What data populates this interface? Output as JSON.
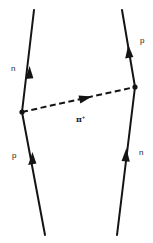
{
  "diagram": {
    "type": "feynman",
    "colors": {
      "line": "#141414",
      "background": "#ffffff",
      "text": "#1a1a1a"
    },
    "left_line": {
      "top_label": "n",
      "bottom_label": "p",
      "points": {
        "top": [
          34,
          10
        ],
        "vertex": [
          22,
          112
        ],
        "bottom": [
          45,
          235
        ]
      }
    },
    "right_line": {
      "top_label": "p",
      "bottom_label": "n",
      "points": {
        "top": [
          122,
          10
        ],
        "vertex": [
          135,
          87
        ],
        "bottom": [
          117,
          235
        ]
      }
    },
    "exchange": {
      "particle": "π",
      "charge": "+",
      "style": "dashed",
      "from": "left_vertex",
      "to": "right_vertex"
    }
  }
}
